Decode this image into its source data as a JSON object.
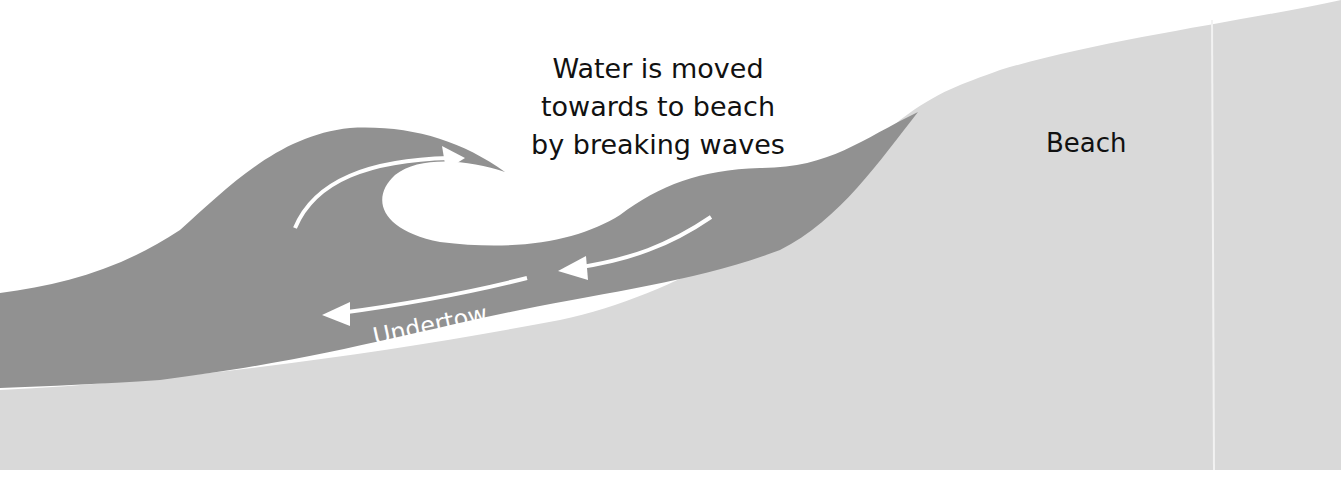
{
  "diagram": {
    "caption": {
      "line1": "Water is moved",
      "line2": "towards to beach",
      "line3": "by breaking waves"
    },
    "beach_label": "Beach",
    "undertow_label": "Undertow",
    "colors": {
      "water": "#919191",
      "sand": "#d9d9d9",
      "background": "#ffffff",
      "arrows": "#ffffff",
      "text": "#111111"
    }
  }
}
